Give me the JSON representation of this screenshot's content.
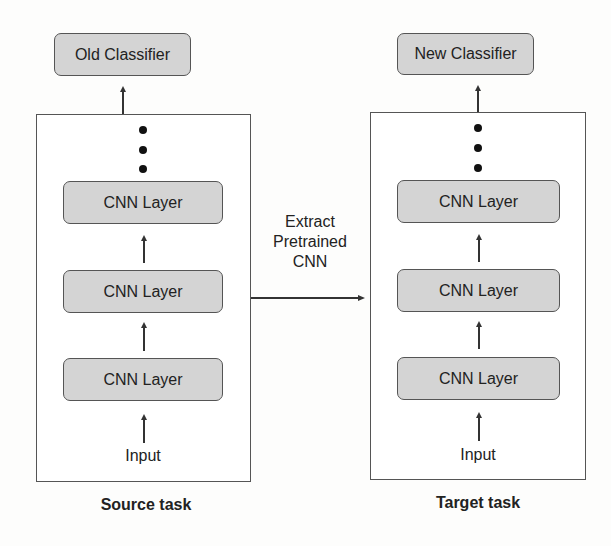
{
  "source": {
    "classifier_label": "Old Classifier",
    "layers": [
      "CNN Layer",
      "CNN Layer",
      "CNN Layer"
    ],
    "input_label": "Input",
    "caption": "Source task"
  },
  "target": {
    "classifier_label": "New Classifier",
    "layers": [
      "CNN Layer",
      "CNN Layer",
      "CNN Layer"
    ],
    "input_label": "Input",
    "caption": "Target task"
  },
  "transfer": {
    "lines": [
      "Extract",
      "Pretrained",
      "CNN"
    ]
  },
  "colors": {
    "node_fill": "#d4d4d4",
    "border": "#555555",
    "text": "#222222"
  }
}
